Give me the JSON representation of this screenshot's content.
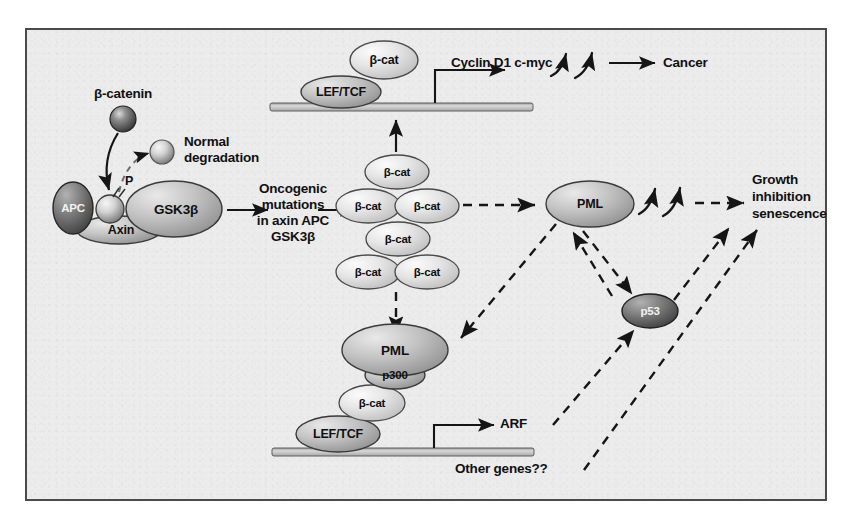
{
  "figure": {
    "domain": "diagram",
    "background_color": "#ececec",
    "border_color": "#4a4a4a",
    "canvas": {
      "width": 855,
      "height": 518
    }
  },
  "labels": {
    "beta_catenin": "β-catenin",
    "normal_degradation_line1": "Normal",
    "normal_degradation_line2": "degradation",
    "phosphate": "P",
    "apc": "APC",
    "gsk3b": "GSK3β",
    "axin": "Axin",
    "oncogenic_line1": "Oncogenic",
    "oncogenic_line2": "mutations",
    "oncogenic_line3": "in axin APC",
    "oncogenic_line4": "GSK3β",
    "cyclin_cmyc": "Cyclin D1 c-myc",
    "cancer": "Cancer",
    "growth_line1": "Growth",
    "growth_line2": "inhibition",
    "growth_line3": "senescence",
    "arf": "ARF",
    "other_genes": "Other genes??"
  },
  "nodes": {
    "beta_cat": "β-cat",
    "lef_tcf": "LEF/TCF",
    "pml": "PML",
    "p300": "p300",
    "p53": "p53"
  },
  "complexes": {
    "destruction_complex": {
      "name": "APC / Axin / GSK3β destruction complex",
      "members": [
        "APC",
        "Axin",
        "GSK3β",
        "β-catenin",
        "P"
      ]
    },
    "top_transcription_complex": {
      "name": "LEF/TCF + β-cat on DNA",
      "members": [
        "LEF/TCF",
        "β-cat"
      ],
      "target_genes": "Cyclin D1 c-myc",
      "outcome": "Cancer"
    },
    "beta_cat_pool": {
      "name": "Accumulated β-catenin pool",
      "count": 6,
      "rows": [
        1,
        2,
        1,
        2
      ]
    },
    "bottom_transcription_complex": {
      "name": "PML / p300 / β-cat / LEF-TCF on DNA",
      "members": [
        "PML",
        "p300",
        "β-cat",
        "LEF/TCF"
      ],
      "target_genes": [
        "ARF",
        "Other genes??"
      ]
    }
  },
  "edges": [
    {
      "from": "β-catenin",
      "to": "destruction complex",
      "style": "solid-arrow"
    },
    {
      "from": "destruction complex",
      "to": "Normal degradation",
      "style": "dashed-arrow"
    },
    {
      "from": "destruction complex",
      "to": "Oncogenic mutations",
      "style": "solid-arrow"
    },
    {
      "from": "Oncogenic mutations",
      "to": "β-cat pool",
      "style": "solid-arrow"
    },
    {
      "from": "β-cat pool",
      "to": "LEF/TCF-DNA complex",
      "style": "solid-arrow-up"
    },
    {
      "from": "LEF/TCF-DNA complex",
      "to": "Cyclin D1 c-myc",
      "style": "transcription-bent-arrow"
    },
    {
      "from": "Cyclin D1 c-myc",
      "to": "Cancer",
      "style": "solid-arrow"
    },
    {
      "from": "β-cat pool",
      "to": "PML",
      "style": "dashed-arrow"
    },
    {
      "from": "PML",
      "to": "Growth inhibition senescence",
      "style": "dashed-arrow"
    },
    {
      "from": "β-cat pool",
      "to": "PML/p300 complex",
      "style": "dashed-arrow-down"
    },
    {
      "from": "PML",
      "to": "PML/p300 complex",
      "style": "dashed-arrow"
    },
    {
      "from": "PML",
      "to": "p53",
      "style": "dashed-arrow"
    },
    {
      "from": "p53",
      "to": "PML",
      "style": "dashed-arrow"
    },
    {
      "from": "p53",
      "to": "Growth inhibition senescence",
      "style": "dashed-arrow"
    },
    {
      "from": "ARF",
      "to": "p53",
      "style": "dashed-arrow"
    },
    {
      "from": "Other genes??",
      "to": "Growth inhibition senescence",
      "style": "dashed-arrow"
    }
  ],
  "colors": {
    "panel": "#ececec",
    "oval_light": "#e2e2e2",
    "oval_mid": "#b9b9b9",
    "oval_dark": "#6a6a6a",
    "stroke": "#1a1a1a",
    "dna_bar": "#c9c9c9"
  }
}
